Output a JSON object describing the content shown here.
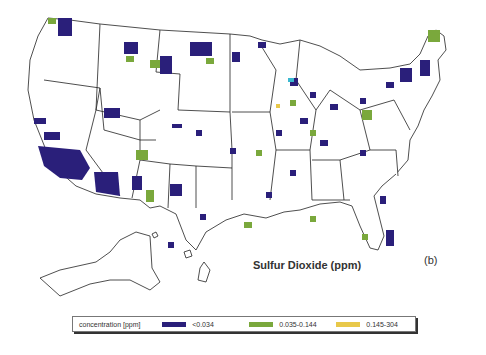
{
  "map": {
    "title": "Sulfur Dioxide (ppm)",
    "panel_label": "(b)",
    "region": "United States (incl. Alaska, Hawaii)"
  },
  "legend": {
    "heading": "concentration [ppm]",
    "items": [
      {
        "label": "<0.034",
        "color": "#2a1f7a"
      },
      {
        "label": "0.035-0.144",
        "color": "#7aa83c"
      },
      {
        "label": "0.145-304",
        "color": "#e8c84a"
      }
    ]
  }
}
